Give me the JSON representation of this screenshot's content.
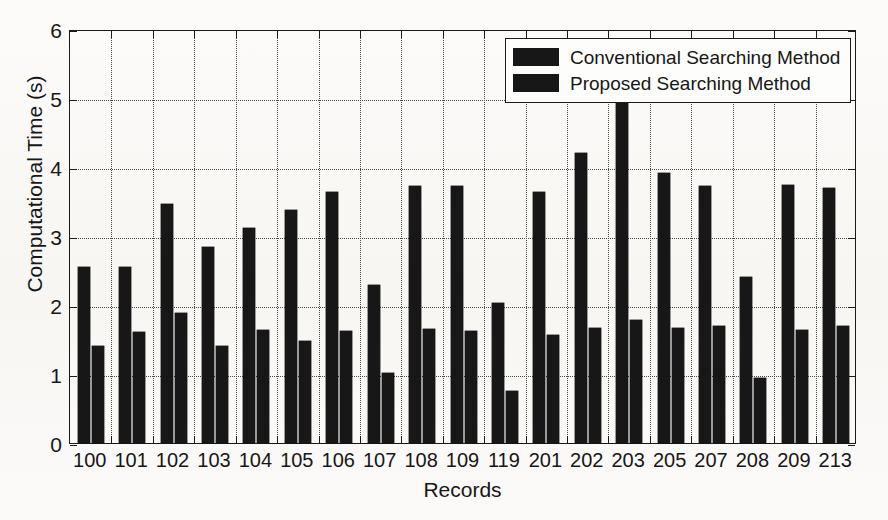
{
  "chart_data": {
    "type": "bar",
    "title": "",
    "xlabel": "Records",
    "ylabel": "Computational Time (s)",
    "ylim": [
      0,
      6
    ],
    "yticks": [
      0,
      1,
      2,
      3,
      4,
      5,
      6
    ],
    "ytick_labels": [
      "0",
      "1",
      "2",
      "3",
      "4",
      "5",
      "6"
    ],
    "grid": true,
    "legend_position": "top-right",
    "categories": [
      "100",
      "101",
      "102",
      "103",
      "104",
      "105",
      "106",
      "107",
      "108",
      "109",
      "119",
      "201",
      "202",
      "203",
      "205",
      "207",
      "208",
      "209",
      "213"
    ],
    "series": [
      {
        "name": "Conventional Searching Method",
        "color": "#171717",
        "values": [
          2.55,
          2.55,
          3.46,
          2.84,
          3.12,
          3.37,
          3.64,
          2.29,
          3.72,
          3.72,
          2.03,
          3.64,
          4.21,
          4.95,
          3.92,
          3.72,
          2.4,
          3.74,
          3.7
        ]
      },
      {
        "name": "Proposed Searching Method",
        "color": "#171717",
        "values": [
          1.4,
          1.61,
          1.88,
          1.4,
          1.64,
          1.48,
          1.63,
          1.01,
          1.65,
          1.63,
          0.75,
          1.57,
          1.66,
          1.79,
          1.66,
          1.7,
          0.94,
          1.64,
          1.69
        ]
      }
    ]
  },
  "legend": {
    "items": [
      {
        "label": "Conventional Searching Method"
      },
      {
        "label": "Proposed Searching Method"
      }
    ]
  }
}
